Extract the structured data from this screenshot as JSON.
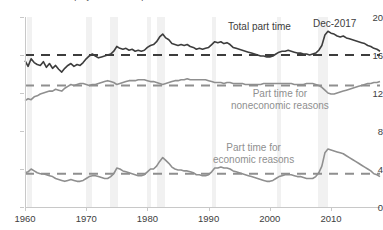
{
  "chart_data": {
    "type": "line",
    "title": "Share of employment that is part time",
    "xlabel": "",
    "ylabel": "",
    "ylim": [
      0,
      20
    ],
    "xlim": [
      1960,
      2018
    ],
    "yticks": [
      0,
      4,
      8,
      12,
      16,
      20
    ],
    "xticks": [
      1960,
      1970,
      1980,
      1990,
      2000,
      2010
    ],
    "grid": false,
    "legend_position": "inline-annotations",
    "annotations": [
      {
        "name": "total-part-time-label",
        "text": "Total part time",
        "x": 1999,
        "y": 18.6
      },
      {
        "name": "noneconomic-label-line1",
        "text": "Part time for",
        "x": 2000,
        "y": 11.6
      },
      {
        "name": "noneconomic-label-line2",
        "text": "noneconomic reasons",
        "x": 2000,
        "y": 10.4
      },
      {
        "name": "economic-label-line1",
        "text": "Part time for",
        "x": 1996,
        "y": 6.2
      },
      {
        "name": "economic-label-line2",
        "text": "economic reasons",
        "x": 1996,
        "y": 5.0
      },
      {
        "name": "end-date-label",
        "text": "Dec-2017",
        "x": 2014,
        "y": 19.0
      }
    ],
    "reference_lines": [
      {
        "name": "total-average",
        "value": 16.0,
        "style": "dashed",
        "color": "#3d3d3d"
      },
      {
        "name": "noneconomic-average",
        "value": 12.8,
        "style": "dashed",
        "color": "#8f8f8f"
      },
      {
        "name": "economic-average",
        "value": 3.5,
        "style": "dashed",
        "color": "#8f8f8f"
      }
    ],
    "recessions": [
      {
        "start": 1960.3,
        "end": 1961.2
      },
      {
        "start": 1969.9,
        "end": 1970.9
      },
      {
        "start": 1973.9,
        "end": 1975.2
      },
      {
        "start": 1980.0,
        "end": 1980.6
      },
      {
        "start": 1981.5,
        "end": 1982.9
      },
      {
        "start": 1990.6,
        "end": 1991.2
      },
      {
        "start": 2001.2,
        "end": 2001.9
      },
      {
        "start": 2007.9,
        "end": 2009.5
      }
    ],
    "series": [
      {
        "name": "Total part time",
        "color": "#3d3d3d",
        "x": [
          1960.0,
          1960.5,
          1961.0,
          1961.5,
          1962.0,
          1962.5,
          1963.0,
          1963.5,
          1964.0,
          1964.5,
          1965.0,
          1965.5,
          1966.0,
          1966.5,
          1967.0,
          1967.5,
          1968.0,
          1968.5,
          1969.0,
          1969.5,
          1970.0,
          1970.5,
          1971.0,
          1971.5,
          1972.0,
          1972.5,
          1973.0,
          1973.5,
          1974.0,
          1974.5,
          1975.0,
          1975.5,
          1976.0,
          1976.5,
          1977.0,
          1977.5,
          1978.0,
          1978.5,
          1979.0,
          1979.5,
          1980.0,
          1980.5,
          1981.0,
          1981.5,
          1982.0,
          1982.5,
          1983.0,
          1983.5,
          1984.0,
          1984.5,
          1985.0,
          1985.5,
          1986.0,
          1986.5,
          1987.0,
          1987.5,
          1988.0,
          1988.5,
          1989.0,
          1989.5,
          1990.0,
          1990.5,
          1991.0,
          1991.5,
          1992.0,
          1992.5,
          1993.0,
          1993.5,
          1994.0,
          1994.5,
          1995.0,
          1995.5,
          1996.0,
          1996.5,
          1997.0,
          1997.5,
          1998.0,
          1998.5,
          1999.0,
          1999.5,
          2000.0,
          2000.5,
          2001.0,
          2001.5,
          2002.0,
          2002.5,
          2003.0,
          2003.5,
          2004.0,
          2004.5,
          2005.0,
          2005.5,
          2006.0,
          2006.5,
          2007.0,
          2007.5,
          2008.0,
          2008.5,
          2009.0,
          2009.5,
          2010.0,
          2010.5,
          2011.0,
          2011.5,
          2012.0,
          2012.5,
          2013.0,
          2013.5,
          2014.0,
          2014.5,
          2015.0,
          2015.5,
          2016.0,
          2016.5,
          2017.0,
          2017.5,
          2018.0
        ],
        "y": [
          15.4,
          14.8,
          15.6,
          15.2,
          15.0,
          14.9,
          15.3,
          14.7,
          15.1,
          14.6,
          14.9,
          14.5,
          14.2,
          14.6,
          14.9,
          15.1,
          14.8,
          15.0,
          14.9,
          15.2,
          15.6,
          15.9,
          16.1,
          15.9,
          15.7,
          15.8,
          15.9,
          16.0,
          16.1,
          16.4,
          16.9,
          16.7,
          16.6,
          16.7,
          16.5,
          16.6,
          16.4,
          16.5,
          16.4,
          16.5,
          16.8,
          17.0,
          17.1,
          17.4,
          17.9,
          18.2,
          17.8,
          17.6,
          17.2,
          17.1,
          17.0,
          17.1,
          17.0,
          17.1,
          16.9,
          16.8,
          16.6,
          16.7,
          16.6,
          16.7,
          16.8,
          17.1,
          17.4,
          17.3,
          17.4,
          17.2,
          17.3,
          17.1,
          16.8,
          16.7,
          16.6,
          16.5,
          16.4,
          16.3,
          16.2,
          16.1,
          16.0,
          15.9,
          15.9,
          15.8,
          15.8,
          15.9,
          16.1,
          16.3,
          16.4,
          16.4,
          16.5,
          16.4,
          16.3,
          16.2,
          16.2,
          16.1,
          16.1,
          16.0,
          16.1,
          16.2,
          16.5,
          17.0,
          18.1,
          18.5,
          18.3,
          18.2,
          18.0,
          17.9,
          18.0,
          17.8,
          17.7,
          17.6,
          17.5,
          17.4,
          17.3,
          17.2,
          17.0,
          16.9,
          16.7,
          16.6,
          16.4
        ],
        "style": "solid"
      },
      {
        "name": "Part time for noneconomic reasons",
        "color": "#8f8f8f",
        "x": [
          1960.0,
          1960.5,
          1961.0,
          1961.5,
          1962.0,
          1962.5,
          1963.0,
          1963.5,
          1964.0,
          1964.5,
          1965.0,
          1965.5,
          1966.0,
          1966.5,
          1967.0,
          1967.5,
          1968.0,
          1968.5,
          1969.0,
          1969.5,
          1970.0,
          1970.5,
          1971.0,
          1971.5,
          1972.0,
          1972.5,
          1973.0,
          1973.5,
          1974.0,
          1974.5,
          1975.0,
          1975.5,
          1976.0,
          1976.5,
          1977.0,
          1977.5,
          1978.0,
          1978.5,
          1979.0,
          1979.5,
          1980.0,
          1980.5,
          1981.0,
          1981.5,
          1982.0,
          1982.5,
          1983.0,
          1983.5,
          1984.0,
          1984.5,
          1985.0,
          1985.5,
          1986.0,
          1986.5,
          1987.0,
          1987.5,
          1988.0,
          1988.5,
          1989.0,
          1989.5,
          1990.0,
          1990.5,
          1991.0,
          1991.5,
          1992.0,
          1992.5,
          1993.0,
          1993.5,
          1994.0,
          1994.5,
          1995.0,
          1995.5,
          1996.0,
          1996.5,
          1997.0,
          1997.5,
          1998.0,
          1998.5,
          1999.0,
          1999.5,
          2000.0,
          2000.5,
          2001.0,
          2001.5,
          2002.0,
          2002.5,
          2003.0,
          2003.5,
          2004.0,
          2004.5,
          2005.0,
          2005.5,
          2006.0,
          2006.5,
          2007.0,
          2007.5,
          2008.0,
          2008.5,
          2009.0,
          2009.5,
          2010.0,
          2010.5,
          2011.0,
          2011.5,
          2012.0,
          2012.5,
          2013.0,
          2013.5,
          2014.0,
          2014.5,
          2015.0,
          2015.5,
          2016.0,
          2016.5,
          2017.0,
          2017.5,
          2018.0
        ],
        "y": [
          11.2,
          11.4,
          11.3,
          11.6,
          11.7,
          11.9,
          12.0,
          12.1,
          12.2,
          12.2,
          12.4,
          12.3,
          12.2,
          12.5,
          12.7,
          12.9,
          12.8,
          12.9,
          13.0,
          13.0,
          12.9,
          12.8,
          12.9,
          12.9,
          13.0,
          13.1,
          13.2,
          13.3,
          13.2,
          13.1,
          12.9,
          13.0,
          13.1,
          13.2,
          13.3,
          13.3,
          13.3,
          13.4,
          13.4,
          13.4,
          13.3,
          13.2,
          13.2,
          13.1,
          13.0,
          12.9,
          13.0,
          13.1,
          13.2,
          13.3,
          13.3,
          13.4,
          13.4,
          13.5,
          13.4,
          13.4,
          13.4,
          13.4,
          13.4,
          13.4,
          13.3,
          13.2,
          13.1,
          13.1,
          13.1,
          13.0,
          13.1,
          13.1,
          13.0,
          13.0,
          13.0,
          13.0,
          12.9,
          12.9,
          12.9,
          12.9,
          12.9,
          12.9,
          13.0,
          13.0,
          13.0,
          13.0,
          13.0,
          13.0,
          13.0,
          13.0,
          13.0,
          13.0,
          12.9,
          12.9,
          12.9,
          12.9,
          13.0,
          13.0,
          13.0,
          12.9,
          12.8,
          12.6,
          12.3,
          12.0,
          11.9,
          11.9,
          12.0,
          12.1,
          12.2,
          12.3,
          12.4,
          12.5,
          12.6,
          12.7,
          12.8,
          12.9,
          13.0,
          13.0,
          13.1,
          13.1,
          13.2
        ],
        "style": "solid"
      },
      {
        "name": "Part time for economic reasons",
        "color": "#8f8f8f",
        "x": [
          1960.0,
          1960.5,
          1961.0,
          1961.5,
          1962.0,
          1962.5,
          1963.0,
          1963.5,
          1964.0,
          1964.5,
          1965.0,
          1965.5,
          1966.0,
          1966.5,
          1967.0,
          1967.5,
          1968.0,
          1968.5,
          1969.0,
          1969.5,
          1970.0,
          1970.5,
          1971.0,
          1971.5,
          1972.0,
          1972.5,
          1973.0,
          1973.5,
          1974.0,
          1974.5,
          1975.0,
          1975.5,
          1976.0,
          1976.5,
          1977.0,
          1977.5,
          1978.0,
          1978.5,
          1979.0,
          1979.5,
          1980.0,
          1980.5,
          1981.0,
          1981.5,
          1982.0,
          1982.5,
          1983.0,
          1983.5,
          1984.0,
          1984.5,
          1985.0,
          1985.5,
          1986.0,
          1986.5,
          1987.0,
          1987.5,
          1988.0,
          1988.5,
          1989.0,
          1989.5,
          1990.0,
          1990.5,
          1991.0,
          1991.5,
          1992.0,
          1992.5,
          1993.0,
          1993.5,
          1994.0,
          1994.5,
          1995.0,
          1995.5,
          1996.0,
          1996.5,
          1997.0,
          1997.5,
          1998.0,
          1998.5,
          1999.0,
          1999.5,
          2000.0,
          2000.5,
          2001.0,
          2001.5,
          2002.0,
          2002.5,
          2003.0,
          2003.5,
          2004.0,
          2004.5,
          2005.0,
          2005.5,
          2006.0,
          2006.5,
          2007.0,
          2007.5,
          2008.0,
          2008.5,
          2009.0,
          2009.5,
          2010.0,
          2010.5,
          2011.0,
          2011.5,
          2012.0,
          2012.5,
          2013.0,
          2013.5,
          2014.0,
          2014.5,
          2015.0,
          2015.5,
          2016.0,
          2016.5,
          2017.0,
          2017.5,
          2018.0
        ],
        "y": [
          3.6,
          3.7,
          4.0,
          3.8,
          3.6,
          3.5,
          3.5,
          3.4,
          3.3,
          3.2,
          3.0,
          2.9,
          2.8,
          2.7,
          2.8,
          2.9,
          2.8,
          2.7,
          2.7,
          2.8,
          3.0,
          3.2,
          3.3,
          3.3,
          3.2,
          3.1,
          3.0,
          3.0,
          3.2,
          3.5,
          4.1,
          4.0,
          3.8,
          3.7,
          3.6,
          3.5,
          3.4,
          3.3,
          3.3,
          3.4,
          3.7,
          4.0,
          4.0,
          4.3,
          4.8,
          5.2,
          4.9,
          4.6,
          4.2,
          4.0,
          3.9,
          3.9,
          3.8,
          3.8,
          3.7,
          3.6,
          3.4,
          3.4,
          3.3,
          3.3,
          3.4,
          3.7,
          4.1,
          4.1,
          4.2,
          4.1,
          4.1,
          4.0,
          3.8,
          3.7,
          3.6,
          3.5,
          3.4,
          3.3,
          3.2,
          3.1,
          3.0,
          2.9,
          2.8,
          2.7,
          2.7,
          2.8,
          3.0,
          3.2,
          3.3,
          3.4,
          3.4,
          3.4,
          3.3,
          3.2,
          3.2,
          3.1,
          3.0,
          3.0,
          3.0,
          3.2,
          3.6,
          4.3,
          5.7,
          6.1,
          6.0,
          5.9,
          5.8,
          5.7,
          5.6,
          5.4,
          5.2,
          5.0,
          4.8,
          4.6,
          4.4,
          4.2,
          4.0,
          3.8,
          3.5,
          3.4,
          3.2
        ],
        "style": "solid"
      }
    ]
  }
}
